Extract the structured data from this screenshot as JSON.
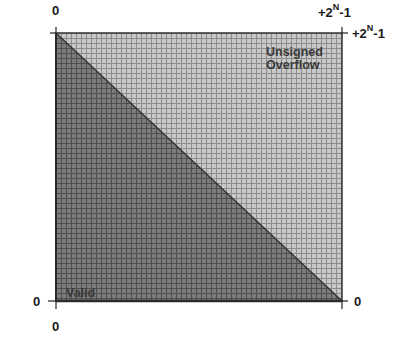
{
  "diagram": {
    "type": "two-operand unsigned addition overflow map",
    "colors": {
      "valid_fill": "#7a7a7a",
      "overflow_fill": "#c4c4c4",
      "grid_line_dark": "#4a4a4a",
      "grid_line_light": "#8a8a8a",
      "border": "#333333",
      "text": "#1a1a1a"
    },
    "grid_cells": 57,
    "labels": {
      "top_left_x": "0",
      "top_right_x_base": "+2",
      "top_right_x_sup": "N",
      "top_right_x_suffix": "-1",
      "right_top_y_base": "+2",
      "right_top_y_sup": "N",
      "right_top_y_suffix": "-1",
      "left_bottom_y": "0",
      "bottom_left_x": "0",
      "right_bottom_y": "0"
    },
    "regions": {
      "overflow_line1": "Unsigned",
      "overflow_line2": "Overflow",
      "valid": "Valid"
    }
  }
}
